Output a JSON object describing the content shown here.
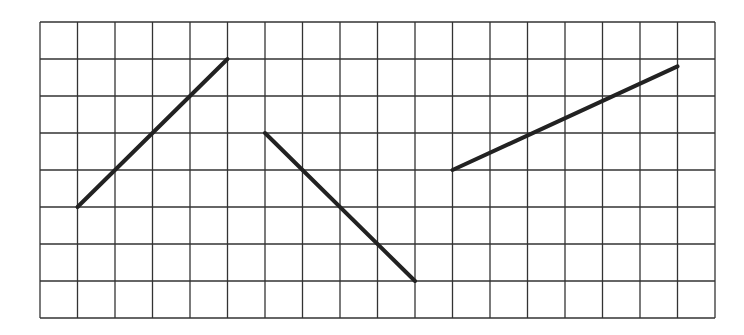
{
  "diagram": {
    "type": "grid-with-line-segments",
    "grid": {
      "columns": 18,
      "rows": 8,
      "origin_px": [
        40,
        22
      ],
      "cell_w": 37.5,
      "cell_h": 37,
      "line_color": "#333333"
    },
    "segments": [
      {
        "name": "segment-1",
        "from": [
          1,
          5
        ],
        "to": [
          5,
          1
        ],
        "color": "#222222"
      },
      {
        "name": "segment-2",
        "from": [
          6,
          3
        ],
        "to": [
          10,
          7
        ],
        "color": "#222222"
      },
      {
        "name": "segment-3",
        "from": [
          11,
          4
        ],
        "to": [
          17,
          1.2
        ],
        "color": "#222222"
      }
    ]
  }
}
